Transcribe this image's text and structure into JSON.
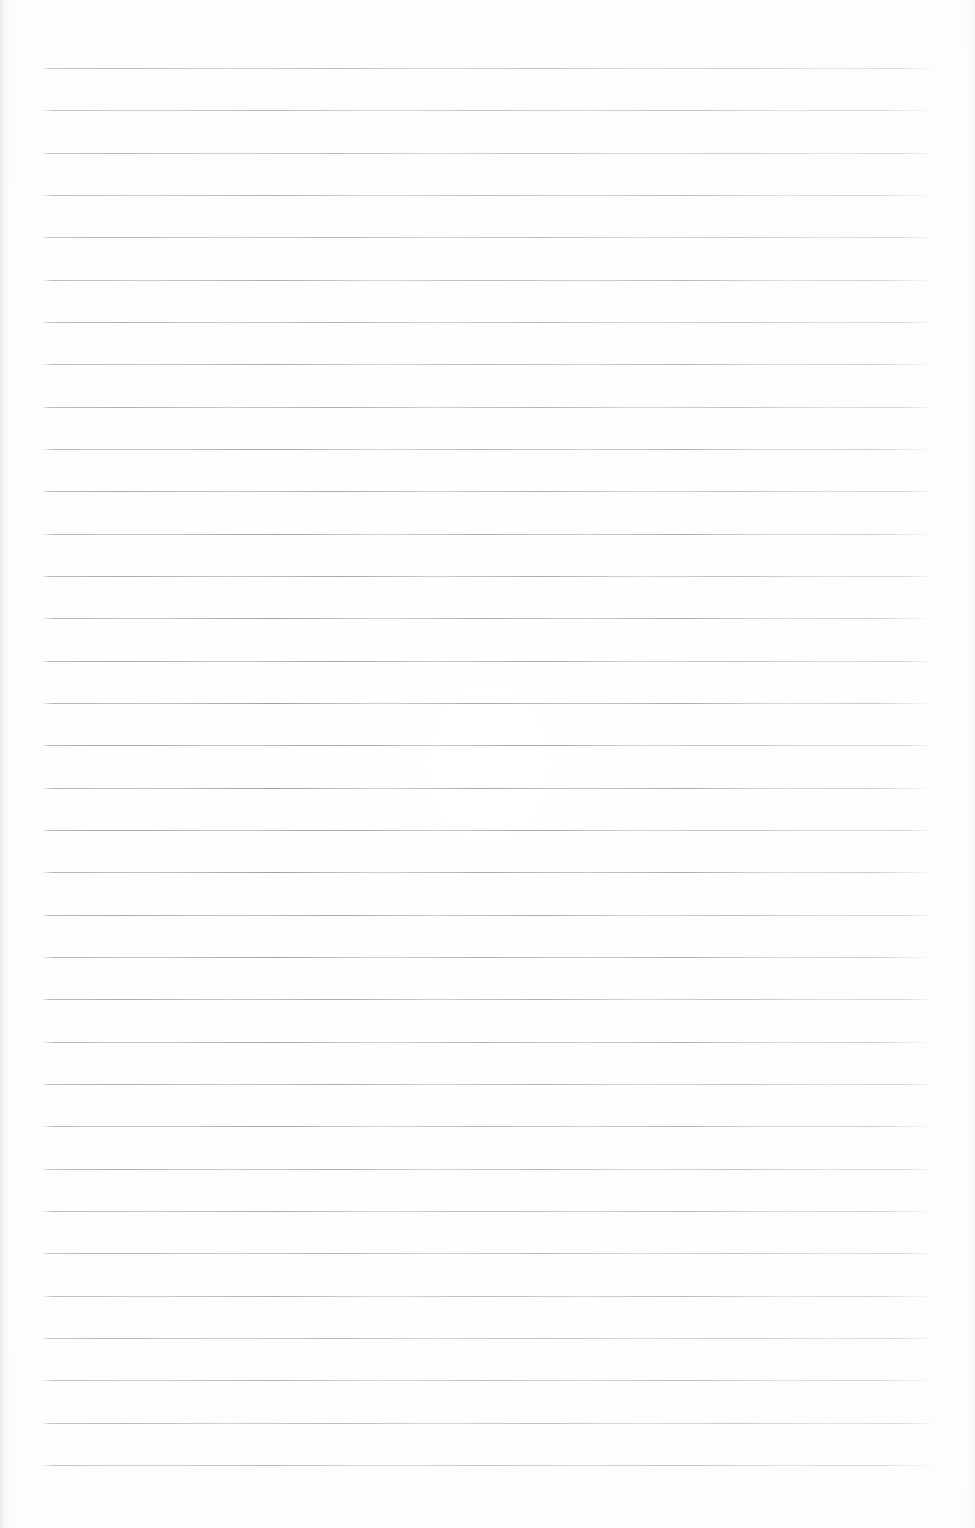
{
  "document": {
    "type": "scanned-blank-lined-notebook-page",
    "page_width": 975,
    "page_height": 1528,
    "background_color": "#ffffff",
    "has_text_content": false,
    "visible_text": "",
    "handwriting_present": false
  },
  "ruling": {
    "line_color": "#9a9aa2",
    "line_count": 34,
    "first_line_y": 68,
    "line_spacing": 42.4,
    "line_left_x": 42,
    "line_right_x": 935,
    "line_thickness": 1.35,
    "orientation": "horizontal",
    "margin_rule_present": false,
    "ys": [
      68,
      110,
      153,
      195,
      237,
      280,
      322,
      364,
      407,
      449,
      491,
      534,
      576,
      618,
      661,
      703,
      745,
      788,
      830,
      872,
      915,
      957,
      999,
      1042,
      1084,
      1126,
      1169,
      1211,
      1253,
      1296,
      1338,
      1380,
      1423,
      1465
    ],
    "grain_alt_indices": [
      1,
      3,
      5,
      7,
      9,
      11,
      13,
      15,
      17,
      19,
      21,
      23,
      25,
      27,
      29,
      31,
      33
    ]
  },
  "scan_artifacts": {
    "left_edge_shadow": true,
    "right_edge_shadow": true,
    "paper_vignette": true,
    "speckle_noise": "minimal"
  }
}
